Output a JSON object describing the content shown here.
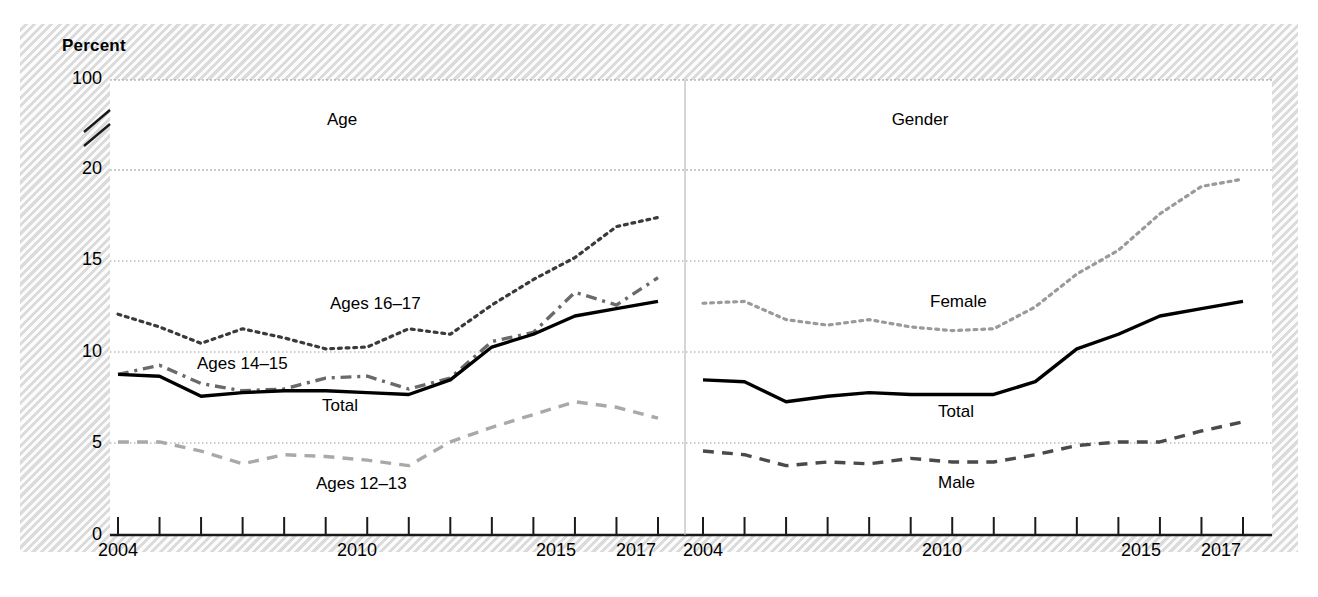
{
  "figure": {
    "y_axis_title": "Percent",
    "panels": [
      {
        "title": "Age"
      },
      {
        "title": "Gender"
      }
    ]
  },
  "chart_data": {
    "type": "line",
    "title": "",
    "xlabel": "",
    "ylabel": "Percent",
    "xlim": [
      2004,
      2017
    ],
    "ylim": [
      0,
      20
    ],
    "y_axis_break": true,
    "y_axis_break_between": [
      20,
      100
    ],
    "grid": true,
    "legend_position": "inline-labels",
    "yticks": [
      "0",
      "5",
      "10",
      "15",
      "20",
      "100"
    ],
    "ytick_values": [
      0,
      5,
      10,
      15,
      20,
      100
    ],
    "xticks": [
      "2004",
      "2010",
      "2015",
      "2017"
    ],
    "xtick_values": [
      2004,
      2010,
      2015,
      2017
    ],
    "x": [
      2004,
      2005,
      2006,
      2007,
      2008,
      2009,
      2010,
      2011,
      2012,
      2013,
      2014,
      2015,
      2016,
      2017
    ],
    "panels": [
      {
        "name": "Age",
        "series": [
          {
            "name": "Ages 16–17",
            "style": "dotted",
            "color": "#3a3a3a",
            "values": [
              12.1,
              11.4,
              10.5,
              11.3,
              10.8,
              10.2,
              10.3,
              11.3,
              11.0,
              12.6,
              14.0,
              15.2,
              16.9,
              17.4
            ]
          },
          {
            "name": "Ages 14–15",
            "style": "dash-dot",
            "color": "#6a6a6a",
            "values": [
              8.8,
              9.3,
              8.3,
              7.9,
              8.0,
              8.6,
              8.7,
              8.0,
              8.6,
              10.6,
              11.1,
              13.3,
              12.6,
              14.1
            ]
          },
          {
            "name": "Total",
            "style": "solid",
            "color": "#000000",
            "values": [
              8.8,
              8.7,
              7.6,
              7.8,
              7.9,
              7.9,
              7.8,
              7.7,
              8.5,
              10.3,
              11.0,
              12.0,
              12.4,
              12.8
            ]
          },
          {
            "name": "Ages 12–13",
            "style": "dashed",
            "color": "#a9a9a9",
            "values": [
              5.1,
              5.1,
              4.6,
              3.9,
              4.4,
              4.3,
              4.1,
              3.8,
              5.1,
              5.9,
              6.6,
              7.3,
              7.0,
              6.4
            ]
          }
        ]
      },
      {
        "name": "Gender",
        "series": [
          {
            "name": "Female",
            "style": "dotted",
            "color": "#9a9a9a",
            "values": [
              12.7,
              12.8,
              11.8,
              11.5,
              11.8,
              11.4,
              11.2,
              11.3,
              12.5,
              14.3,
              15.6,
              17.6,
              19.1,
              19.5
            ]
          },
          {
            "name": "Total",
            "style": "solid",
            "color": "#000000",
            "values": [
              8.5,
              8.4,
              7.3,
              7.6,
              7.8,
              7.7,
              7.7,
              7.7,
              8.4,
              10.2,
              11.0,
              12.0,
              12.4,
              12.8
            ]
          },
          {
            "name": "Male",
            "style": "dashed",
            "color": "#4a4a4a",
            "values": [
              4.6,
              4.4,
              3.8,
              4.0,
              3.9,
              4.2,
              4.0,
              4.0,
              4.4,
              4.9,
              5.1,
              5.1,
              5.7,
              6.2
            ]
          }
        ]
      }
    ]
  }
}
